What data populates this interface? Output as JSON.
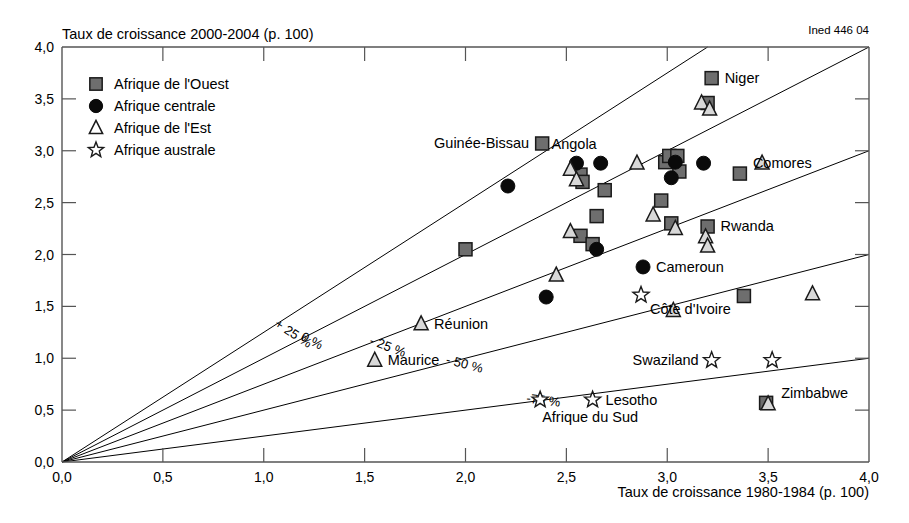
{
  "credit": "Ined 446 04",
  "chart_data": {
    "type": "scatter",
    "title": "",
    "ylabel": "Taux de croissance 2000-2004 (p. 100)",
    "xlabel": "Taux de croissance 1980-1984 (p. 100)",
    "xlim": [
      0.0,
      4.0
    ],
    "ylim": [
      0.0,
      4.0
    ],
    "grid": false,
    "xticks": [
      "0,0",
      "0,5",
      "1,0",
      "1,5",
      "2,0",
      "2,5",
      "3,0",
      "3,5",
      "4,0"
    ],
    "xtick_values": [
      0.0,
      0.5,
      1.0,
      1.5,
      2.0,
      2.5,
      3.0,
      3.5,
      4.0
    ],
    "yticks": [
      "0,0",
      "0,5",
      "1,0",
      "1,5",
      "2,0",
      "2,5",
      "3,0",
      "3,5",
      "4,0"
    ],
    "ytick_values": [
      0.0,
      0.5,
      1.0,
      1.5,
      2.0,
      2.5,
      3.0,
      3.5,
      4.0
    ],
    "legend_position": "top-left",
    "legend": [
      {
        "label": "Afrique de l'Ouest",
        "marker": "square",
        "color": "#6e6e6e"
      },
      {
        "label": "Afrique centrale",
        "marker": "circle",
        "color": "#0a0a0a"
      },
      {
        "label": "Afrique de l'Est",
        "marker": "triangle",
        "color": "#d8d8d8"
      },
      {
        "label": "Afrique australe",
        "marker": "star",
        "color": "#ffffff"
      }
    ],
    "reference_lines": [
      {
        "label": "+ 25 %",
        "slope": 1.25,
        "label_x": 1.05,
        "label_y": 1.31
      },
      {
        "label": "0 %",
        "slope": 1.0,
        "label_x": 1.18,
        "label_y": 1.18
      },
      {
        "label": "- 25 %",
        "slope": 0.75,
        "label_x": 1.52,
        "label_y": 1.14
      },
      {
        "label": "- 50 %",
        "slope": 0.5,
        "label_x": 1.9,
        "label_y": 0.95
      },
      {
        "label": "-75 %",
        "slope": 0.25,
        "label_x": 2.3,
        "label_y": 0.575
      }
    ],
    "series": [
      {
        "name": "Afrique de l'Ouest",
        "marker": "square",
        "points": [
          {
            "x": 2.0,
            "y": 2.05,
            "label": ""
          },
          {
            "x": 2.38,
            "y": 3.07,
            "label": "Guinée-Bissau",
            "label_pos": "left"
          },
          {
            "x": 2.57,
            "y": 2.77,
            "label": ""
          },
          {
            "x": 2.58,
            "y": 2.7,
            "label": ""
          },
          {
            "x": 2.69,
            "y": 2.62,
            "label": ""
          },
          {
            "x": 2.65,
            "y": 2.37,
            "label": ""
          },
          {
            "x": 2.57,
            "y": 2.18,
            "label": ""
          },
          {
            "x": 2.63,
            "y": 2.1,
            "label": ""
          },
          {
            "x": 2.99,
            "y": 2.89,
            "label": ""
          },
          {
            "x": 3.01,
            "y": 2.95,
            "label": ""
          },
          {
            "x": 3.05,
            "y": 2.95,
            "label": ""
          },
          {
            "x": 3.06,
            "y": 2.8,
            "label": ""
          },
          {
            "x": 3.2,
            "y": 3.46,
            "label": ""
          },
          {
            "x": 3.22,
            "y": 3.7,
            "label": "Niger",
            "label_pos": "right"
          },
          {
            "x": 3.36,
            "y": 2.78,
            "label": "Comores",
            "label_pos": "right-up"
          },
          {
            "x": 2.97,
            "y": 2.52,
            "label": ""
          },
          {
            "x": 3.02,
            "y": 2.3,
            "label": ""
          },
          {
            "x": 3.2,
            "y": 2.27,
            "label": "Rwanda",
            "label_pos": "right"
          },
          {
            "x": 3.38,
            "y": 1.6,
            "label": "Côte d'Ivoire",
            "label_pos": "left-down"
          },
          {
            "x": 3.49,
            "y": 0.57,
            "label": ""
          }
        ]
      },
      {
        "name": "Afrique centrale",
        "marker": "circle",
        "points": [
          {
            "x": 2.21,
            "y": 2.66,
            "label": ""
          },
          {
            "x": 2.55,
            "y": 2.88,
            "label": ""
          },
          {
            "x": 2.67,
            "y": 2.88,
            "label": "Angola",
            "label_pos": "up-left"
          },
          {
            "x": 2.65,
            "y": 2.05,
            "label": ""
          },
          {
            "x": 2.4,
            "y": 1.59,
            "label": ""
          },
          {
            "x": 3.04,
            "y": 2.89,
            "label": ""
          },
          {
            "x": 3.02,
            "y": 2.74,
            "label": ""
          },
          {
            "x": 3.18,
            "y": 2.88,
            "label": ""
          },
          {
            "x": 2.88,
            "y": 1.88,
            "label": "Cameroun",
            "label_pos": "right"
          }
        ]
      },
      {
        "name": "Afrique de l'Est",
        "marker": "triangle",
        "points": [
          {
            "x": 2.52,
            "y": 2.82,
            "label": ""
          },
          {
            "x": 2.55,
            "y": 2.72,
            "label": ""
          },
          {
            "x": 2.85,
            "y": 2.88,
            "label": ""
          },
          {
            "x": 2.52,
            "y": 2.22,
            "label": ""
          },
          {
            "x": 2.93,
            "y": 2.38,
            "label": ""
          },
          {
            "x": 3.17,
            "y": 3.46,
            "label": ""
          },
          {
            "x": 3.21,
            "y": 3.4,
            "label": ""
          },
          {
            "x": 3.47,
            "y": 2.88,
            "label": ""
          },
          {
            "x": 3.04,
            "y": 2.25,
            "label": ""
          },
          {
            "x": 3.19,
            "y": 2.17,
            "label": ""
          },
          {
            "x": 3.2,
            "y": 2.08,
            "label": ""
          },
          {
            "x": 2.45,
            "y": 1.8,
            "label": ""
          },
          {
            "x": 3.03,
            "y": 1.46,
            "label": ""
          },
          {
            "x": 3.72,
            "y": 1.62,
            "label": ""
          },
          {
            "x": 1.78,
            "y": 1.33,
            "label": "Réunion",
            "label_pos": "right"
          },
          {
            "x": 1.55,
            "y": 0.98,
            "label": "Maurice",
            "label_pos": "right"
          },
          {
            "x": 3.5,
            "y": 0.56,
            "label": "Zimbabwe",
            "label_pos": "right-up"
          }
        ]
      },
      {
        "name": "Afrique australe",
        "marker": "star",
        "points": [
          {
            "x": 2.87,
            "y": 1.61,
            "label": ""
          },
          {
            "x": 3.22,
            "y": 0.98,
            "label": "Swaziland",
            "label_pos": "left"
          },
          {
            "x": 3.52,
            "y": 0.98,
            "label": ""
          },
          {
            "x": 2.37,
            "y": 0.6,
            "label": "Afrique du Sud",
            "label_pos": "down-right"
          },
          {
            "x": 2.63,
            "y": 0.6,
            "label": "Lesotho",
            "label_pos": "right"
          }
        ]
      }
    ]
  }
}
